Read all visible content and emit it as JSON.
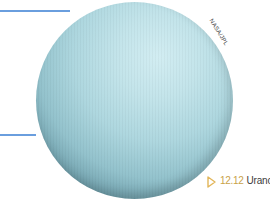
{
  "figure": {
    "image_subject": "Uranus planet",
    "credit": "NASA/JPL",
    "caption": {
      "icon": "triangle-outline-icon",
      "number": "12.12",
      "title": "Urano."
    },
    "colors": {
      "rule": "#6a9ede",
      "caption_number": "#c9a24a",
      "caption_icon": "#e2b65a",
      "caption_text": "#3c3c3c",
      "planet_light": "#d2edf2",
      "planet_dark": "#10232a"
    }
  }
}
